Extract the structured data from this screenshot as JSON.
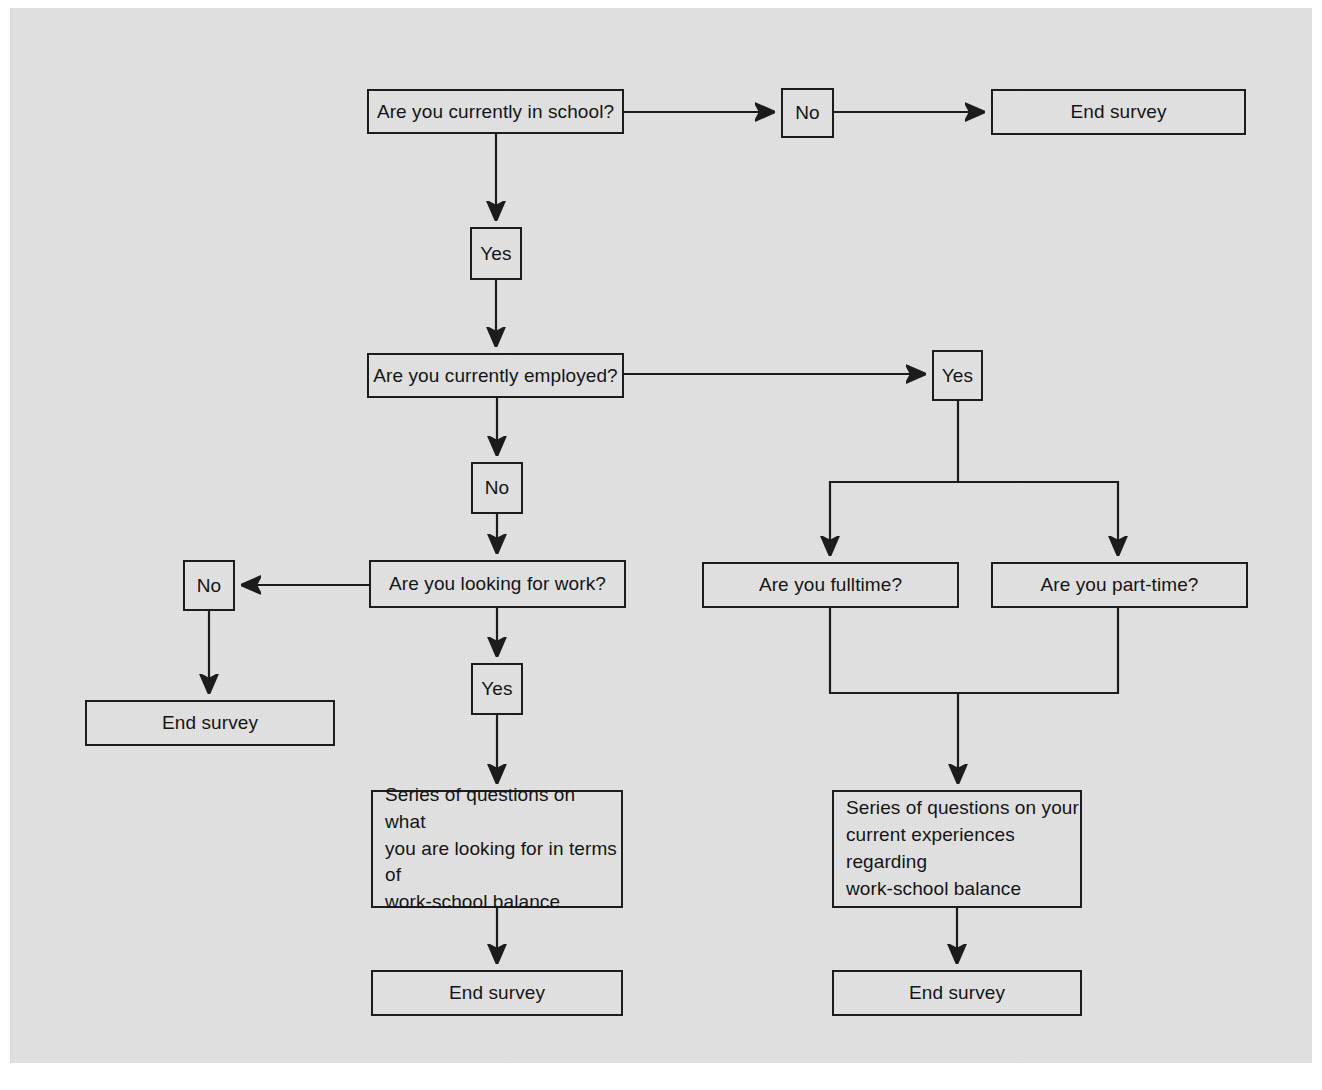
{
  "diagram": {
    "type": "flowchart",
    "background_color": "#e2e2e2",
    "page_color": "#ffffff",
    "line_color": "#1c1c1c",
    "text_color": "#141414"
  },
  "nodes": {
    "q_in_school": {
      "label": "Are you currently in school?",
      "shape": "rectangle",
      "x": 367,
      "y": 89,
      "w": 257,
      "h": 45
    },
    "a_school_no": {
      "label": "No",
      "shape": "rectangle",
      "x": 781,
      "y": 88,
      "w": 53,
      "h": 50
    },
    "end_survey_top": {
      "label": "End survey",
      "shape": "rectangle",
      "x": 991,
      "y": 89,
      "w": 255,
      "h": 46
    },
    "a_school_yes": {
      "label": "Yes",
      "shape": "rectangle",
      "x": 470,
      "y": 227,
      "w": 52,
      "h": 53
    },
    "q_employed": {
      "label": "Are you currently employed?",
      "shape": "rectangle",
      "x": 367,
      "y": 353,
      "w": 257,
      "h": 45
    },
    "a_employed_yes": {
      "label": "Yes",
      "shape": "rectangle",
      "x": 932,
      "y": 350,
      "w": 51,
      "h": 51
    },
    "a_employed_no": {
      "label": "No",
      "shape": "rectangle",
      "x": 471,
      "y": 462,
      "w": 52,
      "h": 52
    },
    "q_looking_work": {
      "label": "Are you looking for work?",
      "shape": "rectangle",
      "x": 369,
      "y": 560,
      "w": 257,
      "h": 48
    },
    "a_looking_no": {
      "label": "No",
      "shape": "rectangle",
      "x": 183,
      "y": 560,
      "w": 52,
      "h": 51
    },
    "end_survey_left": {
      "label": "End survey",
      "shape": "rectangle",
      "x": 85,
      "y": 700,
      "w": 250,
      "h": 46
    },
    "a_looking_yes": {
      "label": "Yes",
      "shape": "rectangle",
      "x": 471,
      "y": 663,
      "w": 52,
      "h": 52
    },
    "q_fulltime": {
      "label": "Are you fulltime?",
      "shape": "rectangle",
      "x": 702,
      "y": 562,
      "w": 257,
      "h": 46
    },
    "q_parttime": {
      "label": "Are you part-time?",
      "shape": "rectangle",
      "x": 991,
      "y": 562,
      "w": 257,
      "h": 46
    },
    "series_looking": {
      "label": "Series of questions on what\nyou are looking for in terms of\nwork-school balance",
      "shape": "rectangle",
      "x": 371,
      "y": 790,
      "w": 252,
      "h": 118
    },
    "series_current": {
      "label": "Series of questions on your\ncurrent experiences regarding\nwork-school balance",
      "shape": "rectangle",
      "x": 832,
      "y": 790,
      "w": 250,
      "h": 118
    },
    "end_survey_bottom_left": {
      "label": "End survey",
      "shape": "rectangle",
      "x": 371,
      "y": 970,
      "w": 252,
      "h": 46
    },
    "end_survey_bottom_right": {
      "label": "End survey",
      "shape": "rectangle",
      "x": 832,
      "y": 970,
      "w": 250,
      "h": 46
    }
  },
  "edges": [
    {
      "from": "q_in_school",
      "to": "a_school_no",
      "label": "",
      "arrow": true
    },
    {
      "from": "a_school_no",
      "to": "end_survey_top",
      "label": "",
      "arrow": true
    },
    {
      "from": "q_in_school",
      "to": "a_school_yes",
      "label": "",
      "arrow": true
    },
    {
      "from": "a_school_yes",
      "to": "q_employed",
      "label": "",
      "arrow": true
    },
    {
      "from": "q_employed",
      "to": "a_employed_yes",
      "label": "",
      "arrow": true
    },
    {
      "from": "q_employed",
      "to": "a_employed_no",
      "label": "",
      "arrow": true
    },
    {
      "from": "a_employed_no",
      "to": "q_looking_work",
      "label": "",
      "arrow": true
    },
    {
      "from": "q_looking_work",
      "to": "a_looking_no",
      "label": "",
      "arrow": true
    },
    {
      "from": "a_looking_no",
      "to": "end_survey_left",
      "label": "",
      "arrow": true
    },
    {
      "from": "q_looking_work",
      "to": "a_looking_yes",
      "label": "",
      "arrow": true
    },
    {
      "from": "a_looking_yes",
      "to": "series_looking",
      "label": "",
      "arrow": true
    },
    {
      "from": "series_looking",
      "to": "end_survey_bottom_left",
      "label": "",
      "arrow": true
    },
    {
      "from": "a_employed_yes",
      "to": "q_fulltime",
      "label": "",
      "arrow": true
    },
    {
      "from": "a_employed_yes",
      "to": "q_parttime",
      "label": "",
      "arrow": true
    },
    {
      "from": "q_fulltime",
      "to": "series_current",
      "label": "",
      "arrow": true
    },
    {
      "from": "q_parttime",
      "to": "series_current",
      "label": "",
      "arrow": true
    },
    {
      "from": "series_current",
      "to": "end_survey_bottom_right",
      "label": "",
      "arrow": true
    }
  ]
}
